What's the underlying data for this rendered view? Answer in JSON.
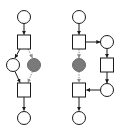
{
  "diagram": {
    "type": "petri-net",
    "colors": {
      "stroke": "#1a1a1a",
      "place_fill": "#ffffff",
      "marked_fill": "#7a7a7a",
      "dashed_arc": "#8a8a8a",
      "background": "#ffffff"
    },
    "nets": [
      {
        "name": "left-net",
        "places": [
          {
            "id": "L_p_top",
            "cx": 24,
            "cy": 17,
            "marked": false
          },
          {
            "id": "L_p_left",
            "cx": 13,
            "cy": 65,
            "marked": false
          },
          {
            "id": "L_p_gray",
            "cx": 34,
            "cy": 65,
            "marked": true
          },
          {
            "id": "L_p_bottom",
            "cx": 24,
            "cy": 118,
            "marked": false
          }
        ],
        "transitions": [
          {
            "id": "L_t_top",
            "x": 17,
            "y": 35
          },
          {
            "id": "L_t_bottom",
            "x": 17,
            "y": 83
          }
        ],
        "arcs": [
          {
            "from": "L_p_top",
            "to": "L_t_top",
            "style": "solid"
          },
          {
            "from": "L_t_top",
            "to": "L_p_left",
            "style": "solid"
          },
          {
            "from": "L_t_top",
            "to": "L_p_gray",
            "style": "dashed"
          },
          {
            "from": "L_p_left",
            "to": "L_t_bottom",
            "style": "solid"
          },
          {
            "from": "L_p_gray",
            "to": "L_t_bottom",
            "style": "dashed"
          },
          {
            "from": "L_t_bottom",
            "to": "L_p_bottom",
            "style": "solid"
          }
        ]
      },
      {
        "name": "right-net",
        "places": [
          {
            "id": "R_p_top",
            "cx": 79,
            "cy": 17,
            "marked": false
          },
          {
            "id": "R_p_right_top",
            "cx": 107,
            "cy": 42,
            "marked": false
          },
          {
            "id": "R_p_gray",
            "cx": 79,
            "cy": 65,
            "marked": true
          },
          {
            "id": "R_p_right_bottom",
            "cx": 107,
            "cy": 90,
            "marked": false
          },
          {
            "id": "R_p_bottom",
            "cx": 79,
            "cy": 118,
            "marked": false
          }
        ],
        "transitions": [
          {
            "id": "R_t_top",
            "x": 72,
            "y": 35
          },
          {
            "id": "R_t_right",
            "x": 101,
            "y": 58
          },
          {
            "id": "R_t_bottom",
            "x": 72,
            "y": 83
          }
        ],
        "arcs": [
          {
            "from": "R_p_top",
            "to": "R_t_top",
            "style": "solid"
          },
          {
            "from": "R_t_top",
            "to": "R_p_right_top",
            "style": "solid"
          },
          {
            "from": "R_t_top",
            "to": "R_p_gray",
            "style": "dashed"
          },
          {
            "from": "R_p_right_top",
            "to": "R_t_right",
            "style": "solid"
          },
          {
            "from": "R_t_right",
            "to": "R_p_right_bottom",
            "style": "solid"
          },
          {
            "from": "R_p_right_bottom",
            "to": "R_t_bottom",
            "style": "solid"
          },
          {
            "from": "R_p_gray",
            "to": "R_t_bottom",
            "style": "dashed"
          },
          {
            "from": "R_t_bottom",
            "to": "R_p_bottom",
            "style": "solid"
          }
        ]
      }
    ]
  }
}
